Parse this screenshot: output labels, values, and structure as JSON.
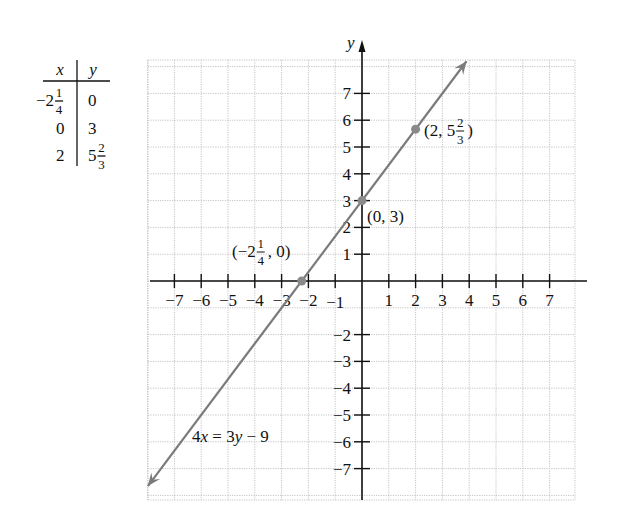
{
  "chart_data": {
    "type": "line",
    "title": "",
    "equation": "4x = 3y - 9",
    "equation_label": "4x = 3y − 9",
    "xlabel": "",
    "ylabel": "y",
    "xlim": [
      -8,
      8
    ],
    "ylim": [
      -8,
      8
    ],
    "grid": true,
    "x_ticks": [
      -7,
      -6,
      -5,
      -4,
      -3,
      -2,
      -1,
      1,
      2,
      3,
      4,
      5,
      6,
      7
    ],
    "x_tick_labels": [
      "−7",
      "−6",
      "−5",
      "−4",
      "−3",
      "−2",
      "−1",
      "1",
      "2",
      "3",
      "4",
      "5",
      "6",
      "7"
    ],
    "y_ticks": [
      7,
      6,
      5,
      4,
      3,
      2,
      1,
      -2,
      -3,
      -4,
      -5,
      -6,
      -7
    ],
    "y_tick_labels": [
      "7",
      "6",
      "5",
      "4",
      "3",
      "2",
      "1",
      "−2",
      "−3",
      "−4",
      "−5",
      "−6",
      "−7"
    ],
    "line": {
      "slope": 1.3333,
      "intercept": 3,
      "x_start": -7.99,
      "x_end": 3.9,
      "arrows": "both",
      "color": "#7b7b7b"
    },
    "points": [
      {
        "x": -2.25,
        "y": 0,
        "label_whole": "(−2",
        "label_num": "1",
        "label_den": "4",
        "label_tail": ", 0)"
      },
      {
        "x": 0,
        "y": 3,
        "label_whole": "(0, 3)",
        "label_num": "",
        "label_den": "",
        "label_tail": ""
      },
      {
        "x": 2,
        "y": 5.6667,
        "label_whole": "(2, 5",
        "label_num": "2",
        "label_den": "3",
        "label_tail": ")"
      }
    ],
    "table": {
      "headers": [
        "x",
        "y"
      ],
      "rows": [
        {
          "x_whole": "−2",
          "x_num": "1",
          "x_den": "4",
          "y_whole": "0",
          "y_num": "",
          "y_den": ""
        },
        {
          "x_whole": "0",
          "x_num": "",
          "x_den": "",
          "y_whole": "3",
          "y_num": "",
          "y_den": ""
        },
        {
          "x_whole": "2",
          "x_num": "",
          "x_den": "",
          "y_whole": "5",
          "y_num": "2",
          "y_den": "3"
        }
      ]
    },
    "colors": {
      "grid": "#c4c4c4",
      "axis": "#111111",
      "line": "#7b7b7b",
      "point": "#8a8a8a"
    }
  }
}
